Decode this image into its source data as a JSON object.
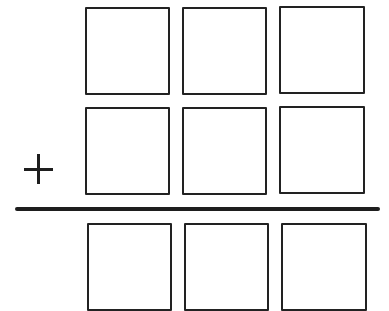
{
  "worksheet": {
    "type": "vertical-addition-template",
    "operator": "+",
    "colors": {
      "stroke": "#222222",
      "background": "#ffffff"
    },
    "rows": [
      {
        "name": "addend-1",
        "digits": [
          "",
          "",
          ""
        ]
      },
      {
        "name": "addend-2",
        "digits": [
          "",
          "",
          ""
        ]
      },
      {
        "name": "sum",
        "digits": [
          "",
          "",
          ""
        ]
      }
    ]
  }
}
